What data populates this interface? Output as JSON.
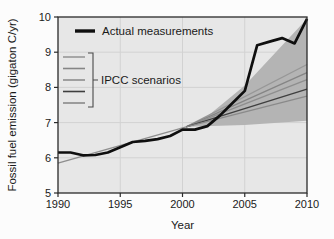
{
  "figure": {
    "background": "#fcfcfc",
    "plot_background": "#e7e7e7",
    "grid_color": "#d2d2d2",
    "frame_color": "#2a2a2a"
  },
  "chart_data": {
    "type": "line",
    "title": "",
    "xlabel": "Year",
    "ylabel": "Fossil fuel emission (gigaton C/yr)",
    "xlim": [
      1990,
      2010
    ],
    "ylim": [
      5,
      10
    ],
    "xticks": [
      "1990",
      "1995",
      "2000",
      "2005",
      "2010"
    ],
    "yticks": [
      "5",
      "6",
      "7",
      "8",
      "9",
      "10"
    ],
    "grid": true,
    "legend_position": "upper-left-inside",
    "legend": {
      "actual_label": "Actual measurements",
      "scenarios_label": "IPCC scenarios"
    },
    "series": [
      {
        "name": "Actual measurements",
        "color": "#0f0f0f",
        "width": 2.7,
        "x": [
          1990,
          1991,
          1992,
          1993,
          1994,
          1995,
          1996,
          1997,
          1998,
          1999,
          2000,
          2001,
          2002,
          2003,
          2004,
          2005,
          2006,
          2007,
          2008,
          2009,
          2010
        ],
        "values": [
          6.15,
          6.15,
          6.07,
          6.08,
          6.15,
          6.3,
          6.45,
          6.48,
          6.53,
          6.62,
          6.8,
          6.8,
          6.9,
          7.2,
          7.55,
          7.9,
          9.2,
          9.3,
          9.4,
          9.25,
          9.95
        ]
      },
      {
        "name": "IPCC scenarios historical baseline",
        "color": "#8e8e8e",
        "width": 1.4,
        "x": [
          1990,
          2000.3
        ],
        "values": [
          5.85,
          6.88
        ]
      },
      {
        "name": "IPCC scenario 1",
        "color": "#979797",
        "width": 1.3,
        "x": [
          2000.3,
          2010
        ],
        "values": [
          6.88,
          8.65
        ]
      },
      {
        "name": "IPCC scenario 2",
        "color": "#858585",
        "width": 1.3,
        "x": [
          2000.3,
          2010
        ],
        "values": [
          6.88,
          8.42
        ]
      },
      {
        "name": "IPCC scenario 3",
        "color": "#8e8e8e",
        "width": 1.3,
        "x": [
          2000.3,
          2010
        ],
        "values": [
          6.88,
          8.22
        ]
      },
      {
        "name": "IPCC scenario 4",
        "color": "#3f3f3f",
        "width": 1.4,
        "x": [
          2000.3,
          2010
        ],
        "values": [
          6.88,
          7.95
        ]
      },
      {
        "name": "IPCC scenario 5",
        "color": "#8a8a8a",
        "width": 1.3,
        "x": [
          2000.3,
          2010
        ],
        "values": [
          6.88,
          7.75
        ]
      }
    ],
    "band": {
      "name": "IPCC scenarios range",
      "color": "#b4b4b4",
      "top": [
        [
          2000.3,
          6.88
        ],
        [
          2002,
          7.18
        ],
        [
          2005,
          8.05
        ],
        [
          2010,
          9.95
        ]
      ],
      "bottom": [
        [
          2010,
          7.05
        ],
        [
          2005,
          6.93
        ],
        [
          2000.3,
          6.88
        ]
      ]
    }
  }
}
